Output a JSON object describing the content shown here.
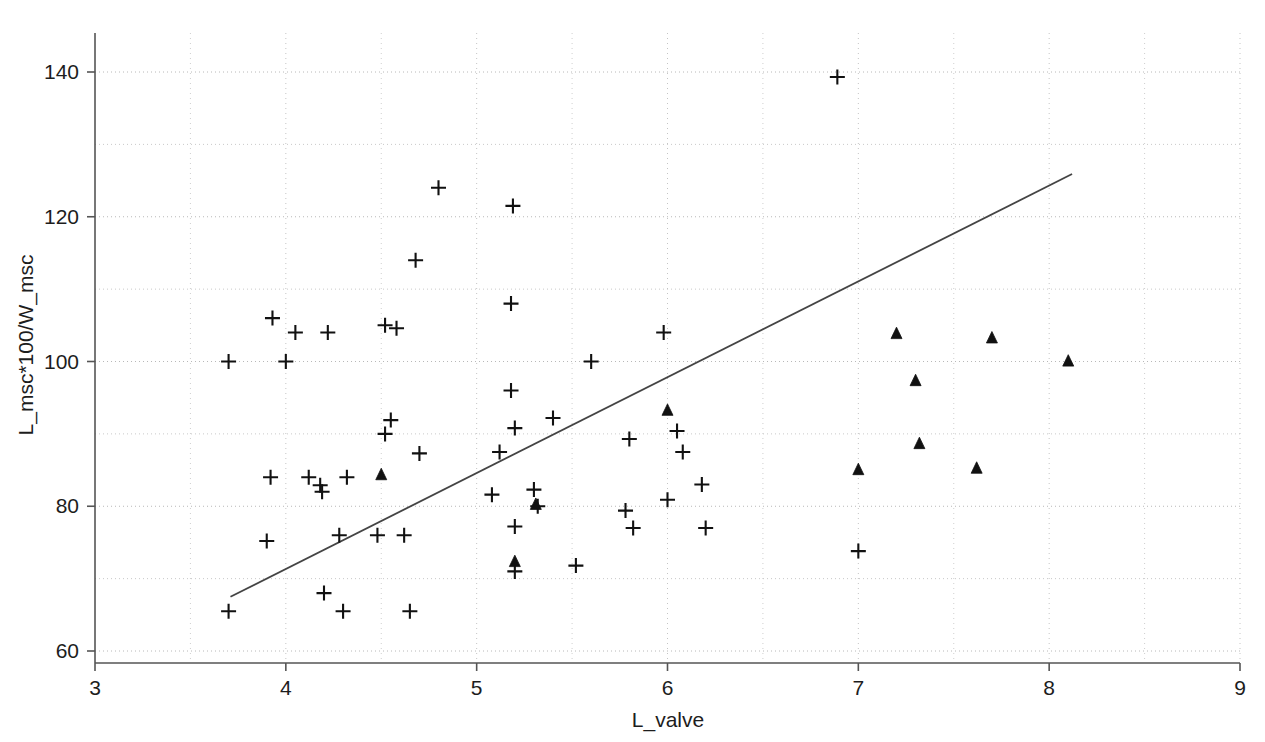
{
  "chart_data": {
    "type": "scatter",
    "title": "",
    "xlabel": "L_valve",
    "ylabel": "L_msc*100/W_msc",
    "xlim": [
      3,
      9
    ],
    "ylim": [
      58,
      146
    ],
    "grid": true,
    "grid_style": "dotted",
    "legend_position": "none",
    "x_major_ticks": [
      3,
      4,
      5,
      6,
      7,
      8,
      9
    ],
    "x_major_tick_labels": [
      "3",
      "4",
      "5",
      "6",
      "7",
      "8",
      "9"
    ],
    "y_major_ticks": [
      60,
      80,
      100,
      120,
      140
    ],
    "y_major_tick_labels": [
      "60",
      "80",
      "100",
      "120",
      "140"
    ],
    "y_minor_gridlines": [
      70,
      90,
      110,
      130
    ],
    "x_minor_gridlines": [
      3.5,
      4.5,
      5.5,
      6.5,
      7.5,
      8.5
    ],
    "marker_color": "#111111",
    "line_color": "#444444",
    "series": [
      {
        "name": "plus-markers",
        "marker": "plus",
        "points": [
          [
            3.7,
            65.5
          ],
          [
            3.7,
            100.0
          ],
          [
            3.9,
            75.2
          ],
          [
            3.92,
            84.0
          ],
          [
            3.93,
            106.0
          ],
          [
            4.0,
            100.0
          ],
          [
            4.05,
            104.0
          ],
          [
            4.12,
            84.0
          ],
          [
            4.18,
            82.9
          ],
          [
            4.19,
            82.0
          ],
          [
            4.2,
            68.0
          ],
          [
            4.22,
            104.0
          ],
          [
            4.28,
            76.0
          ],
          [
            4.3,
            65.5
          ],
          [
            4.32,
            84.0
          ],
          [
            4.48,
            76.0
          ],
          [
            4.52,
            105.0
          ],
          [
            4.52,
            90.0
          ],
          [
            4.55,
            91.9
          ],
          [
            4.58,
            104.6
          ],
          [
            4.62,
            76.0
          ],
          [
            4.65,
            65.5
          ],
          [
            4.68,
            114.0
          ],
          [
            4.7,
            87.3
          ],
          [
            4.8,
            124.0
          ],
          [
            5.08,
            81.6
          ],
          [
            5.12,
            87.5
          ],
          [
            5.18,
            96.0
          ],
          [
            5.18,
            108.0
          ],
          [
            5.19,
            121.5
          ],
          [
            5.2,
            90.8
          ],
          [
            5.2,
            77.2
          ],
          [
            5.2,
            71.0
          ],
          [
            5.3,
            82.3
          ],
          [
            5.32,
            80.0
          ],
          [
            5.4,
            92.2
          ],
          [
            5.52,
            71.8
          ],
          [
            5.6,
            100.0
          ],
          [
            5.78,
            79.4
          ],
          [
            5.8,
            89.3
          ],
          [
            5.82,
            77.0
          ],
          [
            5.98,
            104.0
          ],
          [
            6.0,
            80.9
          ],
          [
            6.05,
            90.4
          ],
          [
            6.08,
            87.5
          ],
          [
            6.18,
            83.0
          ],
          [
            6.2,
            77.0
          ],
          [
            6.89,
            139.3
          ],
          [
            7.0,
            73.8
          ]
        ]
      },
      {
        "name": "triangle-markers",
        "marker": "triangle",
        "points": [
          [
            4.5,
            84.3
          ],
          [
            5.2,
            72.3
          ],
          [
            5.31,
            80.2
          ],
          [
            6.0,
            93.2
          ],
          [
            7.0,
            85.0
          ],
          [
            7.2,
            103.8
          ],
          [
            7.3,
            97.3
          ],
          [
            7.32,
            88.6
          ],
          [
            7.62,
            85.2
          ],
          [
            7.7,
            103.2
          ],
          [
            8.1,
            100.0
          ]
        ]
      }
    ],
    "trend_line": {
      "name": "regression-line",
      "x_start": 3.71,
      "y_start": 67.5,
      "x_end": 8.12,
      "y_end": 125.9
    }
  }
}
